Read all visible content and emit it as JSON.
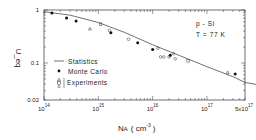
{
  "chart_data": {
    "type": "scatter",
    "title": "",
    "xlabel": "N_A (cm^-3)",
    "xlabel_main": "N",
    "xlabel_sub": "A",
    "xlabel_unit": "( cm",
    "xlabel_unit_exp": "-3",
    "xlabel_close": ")",
    "ylabel": "U_eq",
    "xscale": "log",
    "yscale": "log",
    "xlim": [
      100000000000000.0,
      5e+17
    ],
    "ylim": [
      0.02,
      1
    ],
    "grid": false,
    "x_ticks": [
      {
        "value": 100000000000000.0,
        "base": "10",
        "exp": "14"
      },
      {
        "value": 1000000000000000.0,
        "base": "10",
        "exp": "15"
      },
      {
        "value": 1e+16,
        "base": "10",
        "exp": "16"
      },
      {
        "value": 1e+17,
        "base": "10",
        "exp": "17"
      },
      {
        "value": 5e+17,
        "base": "5x10",
        "exp": "17"
      }
    ],
    "y_ticks": [
      {
        "value": 1,
        "label": "1"
      },
      {
        "value": 0.1,
        "label": "0.1"
      },
      {
        "value": 0.02,
        "label": "0.02"
      }
    ],
    "annotations": [
      "p - Si",
      "T = 77 K"
    ],
    "legend_position": "bottom-left",
    "series": [
      {
        "name": "Statistics",
        "kind": "line",
        "color": "#333333",
        "points": [
          [
            100000000000000.0,
            0.93
          ],
          [
            300000000000000.0,
            0.8
          ],
          [
            1000000000000000.0,
            0.58
          ],
          [
            3000000000000000.0,
            0.38
          ],
          [
            1e+16,
            0.22
          ],
          [
            3e+16,
            0.14
          ],
          [
            1e+17,
            0.085
          ],
          [
            3e+17,
            0.055
          ],
          [
            5e+17,
            0.043
          ]
        ]
      },
      {
        "name": "Monte Carlo",
        "kind": "filled-circle",
        "color": "#111111",
        "points": [
          [
            140000000000000.0,
            0.88
          ],
          [
            260000000000000.0,
            0.71
          ],
          [
            390000000000000.0,
            0.62
          ],
          [
            1700000000000000.0,
            0.37
          ],
          [
            5300000000000000.0,
            0.24
          ],
          [
            1e+16,
            0.18
          ],
          [
            2.1e+16,
            0.14
          ],
          [
            3.3e+17,
            0.062
          ]
        ]
      },
      {
        "name": "Experiments",
        "kind": "open-markers",
        "color": "#333333",
        "points": [
          {
            "x": 700000000000000.0,
            "y": 0.44,
            "marker": "triangle"
          },
          {
            "x": 1100000000000000.0,
            "y": 0.54,
            "marker": "square"
          },
          {
            "x": 1600000000000000.0,
            "y": 0.41,
            "marker": "circle"
          },
          {
            "x": 3600000000000000.0,
            "y": 0.28,
            "marker": "circle"
          },
          {
            "x": 1.25e+16,
            "y": 0.19,
            "marker": "circle"
          },
          {
            "x": 1.4e+16,
            "y": 0.13,
            "marker": "circle"
          },
          {
            "x": 1.6e+16,
            "y": 0.13,
            "marker": "circle"
          },
          {
            "x": 2e+16,
            "y": 0.13,
            "marker": "circle"
          },
          {
            "x": 2.4e+16,
            "y": 0.15,
            "marker": "circle"
          },
          {
            "x": 2.6e+16,
            "y": 0.12,
            "marker": "circle"
          },
          {
            "x": 4.5e+16,
            "y": 0.11,
            "marker": "square"
          },
          {
            "x": 2.4e+17,
            "y": 0.066,
            "marker": "triangle"
          }
        ]
      }
    ],
    "legend": [
      {
        "label": "Statistics",
        "marker": "line"
      },
      {
        "label": "Monte Carlo",
        "marker": "filled-circle"
      },
      {
        "label": "Experiments",
        "marker": "open-stack"
      }
    ]
  }
}
